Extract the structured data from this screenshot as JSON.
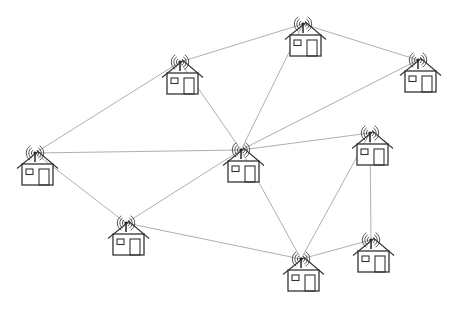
{
  "diagram": {
    "type": "mesh-network",
    "colors": {
      "background": "#ffffff",
      "link": "#9a9a9a",
      "outline": "#333333"
    },
    "nodes": [
      {
        "id": "h1",
        "label": "House 1",
        "icon": "house-with-antenna-icon",
        "x": 180,
        "y": 62
      },
      {
        "id": "h2",
        "label": "House 2",
        "icon": "house-with-antenna-icon",
        "x": 303,
        "y": 24
      },
      {
        "id": "h3",
        "label": "House 3",
        "icon": "house-with-antenna-icon",
        "x": 418,
        "y": 60
      },
      {
        "id": "h4",
        "label": "House 4",
        "icon": "house-with-antenna-icon",
        "x": 35,
        "y": 153
      },
      {
        "id": "h5",
        "label": "House 5",
        "icon": "house-with-antenna-icon",
        "x": 241,
        "y": 150
      },
      {
        "id": "h6",
        "label": "House 6",
        "icon": "house-with-antenna-icon",
        "x": 370,
        "y": 133
      },
      {
        "id": "h7",
        "label": "House 7",
        "icon": "house-with-antenna-icon",
        "x": 126,
        "y": 223
      },
      {
        "id": "h8",
        "label": "House 8",
        "icon": "house-with-antenna-icon",
        "x": 301,
        "y": 259
      },
      {
        "id": "h9",
        "label": "House 9",
        "icon": "house-with-antenna-icon",
        "x": 371,
        "y": 240
      }
    ],
    "edges": [
      [
        "h1",
        "h2"
      ],
      [
        "h1",
        "h4"
      ],
      [
        "h1",
        "h5"
      ],
      [
        "h2",
        "h3"
      ],
      [
        "h2",
        "h5"
      ],
      [
        "h3",
        "h5"
      ],
      [
        "h4",
        "h5"
      ],
      [
        "h4",
        "h7"
      ],
      [
        "h5",
        "h6"
      ],
      [
        "h5",
        "h7"
      ],
      [
        "h5",
        "h8"
      ],
      [
        "h6",
        "h8"
      ],
      [
        "h6",
        "h9"
      ],
      [
        "h7",
        "h8"
      ],
      [
        "h8",
        "h9"
      ]
    ]
  }
}
